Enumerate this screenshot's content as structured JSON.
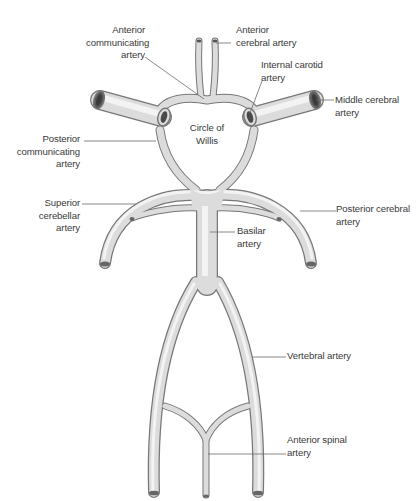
{
  "title": "Circle of Willis",
  "colors": {
    "vessel_fill": "#dedede",
    "vessel_highlight": "#f2f2f2",
    "vessel_outline": "#6f6f6f",
    "lumen": "#555555",
    "leader_line": "#6a6a6a",
    "label_text": "#3a3a3a",
    "background": "#ffffff"
  },
  "labels": {
    "anterior_communicating": [
      "Anterior",
      "communicating",
      "artery"
    ],
    "anterior_cerebral": [
      "Anterior",
      "cerebral artery"
    ],
    "internal_carotid": [
      "Internal carotid",
      "artery"
    ],
    "middle_cerebral": [
      "Middle cerebral",
      "artery"
    ],
    "circle_of_willis": [
      "Circle of",
      "Willis"
    ],
    "posterior_communicating": [
      "Posterior",
      "communicating",
      "artery"
    ],
    "superior_cerebellar": [
      "Superior",
      "cerebellar",
      "artery"
    ],
    "posterior_cerebral": [
      "Posterior cerebral",
      "artery"
    ],
    "basilar": [
      "Basilar",
      "artery"
    ],
    "vertebral": [
      "Vertebral artery"
    ],
    "anterior_spinal": [
      "Anterior spinal",
      "artery"
    ]
  }
}
